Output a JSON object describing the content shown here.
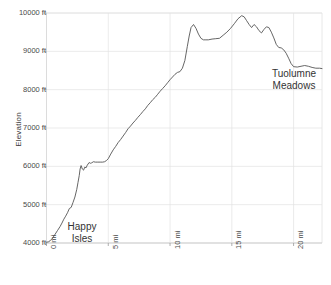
{
  "chart_data": {
    "type": "line",
    "title": "",
    "xlabel": "",
    "ylabel": "Elevation",
    "xlim": [
      0,
      22.3
    ],
    "ylim": [
      4000,
      10000
    ],
    "grid": true,
    "legend": "none",
    "x_unit": "mi",
    "y_unit": "ft",
    "xticks": [
      0,
      5,
      10,
      15,
      20
    ],
    "xtick_labels": [
      "0 mi",
      "5 mi",
      "10 mi",
      "15 mi",
      "20 mi"
    ],
    "yticks": [
      4000,
      5000,
      6000,
      7000,
      8000,
      9000,
      10000
    ],
    "ytick_labels": [
      "4000 ft",
      "5000 ft",
      "6000 ft",
      "7000 ft",
      "8000 ft",
      "9000 ft",
      "10000 ft"
    ],
    "line_color": "#555555",
    "grid_color": "#e2e2e2",
    "series": [
      {
        "name": "Elevation profile",
        "x": [
          0.0,
          0.15,
          0.3,
          0.5,
          0.7,
          0.9,
          1.1,
          1.25,
          1.4,
          1.55,
          1.7,
          1.85,
          2.0,
          2.15,
          2.3,
          2.45,
          2.55,
          2.65,
          2.72,
          2.8,
          2.9,
          3.0,
          3.1,
          3.2,
          3.3,
          3.45,
          3.55,
          3.65,
          3.8,
          3.95,
          4.1,
          4.25,
          4.4,
          4.55,
          4.7,
          4.85,
          5.0,
          5.2,
          5.4,
          5.6,
          5.8,
          6.0,
          6.2,
          6.4,
          6.6,
          6.8,
          7.0,
          7.2,
          7.4,
          7.6,
          7.8,
          8.0,
          8.2,
          8.4,
          8.6,
          8.8,
          9.0,
          9.2,
          9.4,
          9.6,
          9.8,
          10.0,
          10.2,
          10.4,
          10.6,
          10.8,
          11.0,
          11.2,
          11.4,
          11.55,
          11.7,
          11.9,
          12.1,
          12.3,
          12.5,
          12.7,
          12.9,
          13.1,
          13.4,
          13.7,
          14.0,
          14.3,
          14.6,
          14.9,
          15.2,
          15.5,
          15.8,
          16.0,
          16.2,
          16.4,
          16.6,
          16.8,
          17.0,
          17.2,
          17.4,
          17.6,
          17.8,
          18.0,
          18.2,
          18.4,
          18.6,
          18.8,
          19.0,
          19.2,
          19.4,
          19.6,
          19.8,
          20.0,
          20.3,
          20.6,
          20.9,
          21.2,
          21.5,
          21.8,
          22.1,
          22.3
        ],
        "y": [
          4020,
          4030,
          4060,
          4130,
          4230,
          4330,
          4430,
          4520,
          4620,
          4700,
          4790,
          4900,
          4930,
          5060,
          5200,
          5400,
          5580,
          5760,
          5930,
          6020,
          5930,
          5900,
          5980,
          5960,
          6030,
          6100,
          6080,
          6090,
          6120,
          6110,
          6110,
          6110,
          6110,
          6110,
          6120,
          6150,
          6200,
          6320,
          6430,
          6520,
          6620,
          6700,
          6790,
          6880,
          6980,
          7050,
          7130,
          7200,
          7280,
          7350,
          7430,
          7500,
          7590,
          7660,
          7740,
          7800,
          7880,
          7960,
          8030,
          8100,
          8180,
          8260,
          8330,
          8400,
          8450,
          8470,
          8560,
          8760,
          9130,
          9400,
          9620,
          9700,
          9600,
          9450,
          9340,
          9300,
          9300,
          9300,
          9320,
          9330,
          9340,
          9420,
          9500,
          9600,
          9720,
          9850,
          9930,
          9900,
          9800,
          9700,
          9620,
          9700,
          9640,
          9540,
          9480,
          9570,
          9640,
          9620,
          9500,
          9350,
          9180,
          9100,
          9090,
          9040,
          8950,
          8820,
          8680,
          8600,
          8590,
          8610,
          8630,
          8610,
          8580,
          8560,
          8560,
          8550
        ]
      }
    ],
    "annotations": [
      {
        "name": "happy-isles",
        "lines": [
          "Happy",
          "Isles"
        ],
        "x_mi": 1.0,
        "y_ft": 4400
      },
      {
        "name": "tuolumne-meadows",
        "lines": [
          "Tuolumne",
          "Meadows"
        ],
        "x_mi": 20.0,
        "y_ft": 8850
      }
    ]
  },
  "axes": {
    "y_title": "Elevation"
  }
}
